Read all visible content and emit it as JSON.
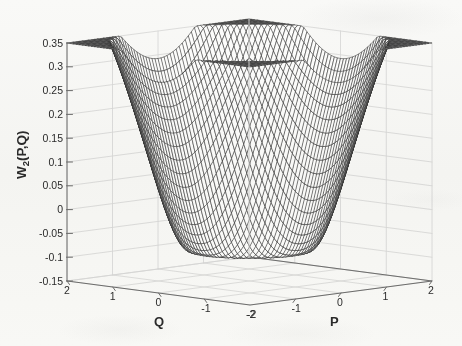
{
  "figure": {
    "kind": "3d-mesh-surface-plot",
    "background_color": "#fbfbfa",
    "mesh_color": "#2d2d2d",
    "axis_color": "#6e6e6e",
    "grid_color": "#d8d8d8",
    "text_color": "#2b2b2b"
  },
  "labels": {
    "ylabel_main": "W",
    "ylabel_sub": "2",
    "ylabel_tail": "(P,Q)",
    "ylabel_full": "W_2(P,Q)",
    "xlabel_p": "P",
    "xlabel_q": "Q"
  },
  "chart_data": {
    "type": "surface",
    "title": "",
    "xlabel": "P",
    "ylabel": "Q",
    "zlabel": "W_2(P,Q)",
    "xlim": [
      -2,
      2
    ],
    "ylim": [
      -2,
      2
    ],
    "zlim": [
      -0.15,
      0.35
    ],
    "grid": true,
    "legend": null,
    "projection": "matlab-mesh-default",
    "view": {
      "azimuth": -37.5,
      "elevation": 30
    },
    "p_ticks": [
      -2,
      -1,
      0,
      1,
      2
    ],
    "p_ticklabels": [
      "-2",
      "-1",
      "0",
      "1",
      "2"
    ],
    "q_ticks": [
      -2,
      -1,
      0,
      1,
      2
    ],
    "q_ticklabels": [
      "-2",
      "-1",
      "0",
      "1",
      "2"
    ],
    "z_ticks": [
      -0.15,
      -0.1,
      -0.05,
      0,
      0.05,
      0.1,
      0.15,
      0.2,
      0.25,
      0.3,
      0.35
    ],
    "z_ticklabels": [
      "-0.15",
      "-0.1",
      "-0.05",
      "0",
      "0.05",
      "0.1",
      "0.15",
      "0.2",
      "0.25",
      "0.3",
      "0.35"
    ],
    "mesh_n": 61,
    "features": {
      "central_peak_value": 0.318,
      "central_peak_at": [
        0,
        0
      ],
      "negative_trough_value": -0.132,
      "negative_trough_radius": 1.0,
      "outer_brim_value": 0.105,
      "outer_brim_radius": 2.0,
      "zero_crossings_radius": [
        0.62,
        1.58
      ]
    },
    "model": {
      "form": "w(r) = A*exp(-a*r^2) - B*r^2*exp(-b*r^2) + C*(r^2)^2*exp(-c*r^2)",
      "A": 0.318,
      "a": 3.05,
      "B": 0.46,
      "b": 1.22,
      "C": 0.049,
      "c": 0.235
    }
  }
}
